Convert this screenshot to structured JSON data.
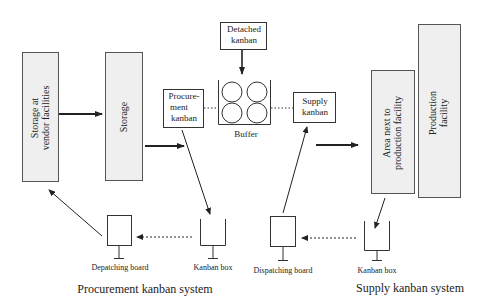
{
  "diagram": {
    "nodes": {
      "storage_vendor": {
        "label": "Storage at vendor facilities",
        "line1": "Storage at",
        "line2": "vendor facilities"
      },
      "storage": {
        "label": "Storage"
      },
      "procurement_kanban": {
        "label": "Procurement kanban",
        "line1": "Procure-",
        "line2": "ment",
        "line3": "kanban"
      },
      "detached_kanban": {
        "label": "Detached kanban",
        "line1": "Detached",
        "line2": "kanban"
      },
      "buffer": {
        "label": "Buffer"
      },
      "supply_kanban": {
        "label": "Supply kanban",
        "line1": "Supply",
        "line2": "kanban"
      },
      "area_next": {
        "label": "Area next to production facility",
        "line1": "Area next to",
        "line2": "production facility"
      },
      "production_facility": {
        "label": "Production facility",
        "line1": "Production",
        "line2": "facility"
      },
      "depatching_board": {
        "label": "Depatching board"
      },
      "kanban_box_left": {
        "label": "Kanban box"
      },
      "dispatching_board": {
        "label": "Dispatching board"
      },
      "kanban_box_right": {
        "label": "Kanban box"
      }
    },
    "systems": {
      "procurement": "Procurement kanban system",
      "supply": "Supply kanban system"
    },
    "colors": {
      "facility_fill": "#efefef",
      "stroke": "#333333"
    }
  }
}
